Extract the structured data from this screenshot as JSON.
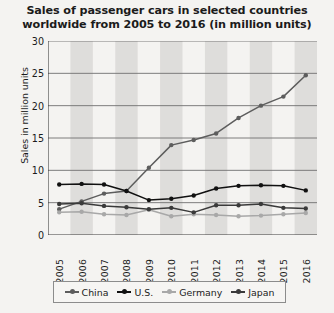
{
  "chart_data": {
    "type": "line",
    "title": "Sales of passenger cars in selected countries worldwide from 2005 to 2016 (in million units)",
    "title_line1": "Sales of passenger cars in selected countries",
    "title_line2": "worldwide from 2005 to 2016 (in million units)",
    "xlabel": "",
    "ylabel": "Sales in million units",
    "categories": [
      "2005",
      "2006",
      "2007",
      "2008",
      "2009",
      "2010",
      "2011",
      "2012",
      "2013",
      "2014",
      "2015",
      "2016"
    ],
    "ylim": [
      0,
      30
    ],
    "yticks": [
      0,
      5,
      10,
      15,
      20,
      25,
      30
    ],
    "grid": "horizontal",
    "legend_position": "bottom",
    "series": [
      {
        "name": "China",
        "color": "#5d5d5d",
        "values": [
          4.0,
          5.2,
          6.4,
          6.8,
          10.4,
          13.9,
          14.7,
          15.7,
          18.1,
          20.0,
          21.4,
          24.7
        ]
      },
      {
        "name": "U.S.",
        "color": "#111111",
        "values": [
          7.8,
          7.9,
          7.8,
          6.8,
          5.4,
          5.6,
          6.1,
          7.2,
          7.6,
          7.7,
          7.6,
          6.9
        ]
      },
      {
        "name": "Germany",
        "color": "#a8a8a8",
        "values": [
          3.5,
          3.6,
          3.2,
          3.1,
          3.9,
          2.9,
          3.2,
          3.1,
          2.9,
          3.0,
          3.2,
          3.4
        ]
      },
      {
        "name": "Japan",
        "color": "#3a3a3a",
        "values": [
          4.8,
          4.9,
          4.5,
          4.3,
          4.0,
          4.2,
          3.5,
          4.6,
          4.6,
          4.8,
          4.2,
          4.1
        ]
      }
    ]
  }
}
